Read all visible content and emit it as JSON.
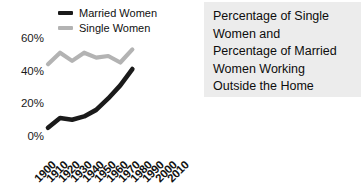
{
  "caption": {
    "lines": [
      "Percentage of Single",
      "Women and",
      "Percentage of Married",
      "Women Working",
      "Outside the Home"
    ],
    "background": "#ececec"
  },
  "legend": {
    "position": "top-left",
    "entries": [
      {
        "label": "Married Women",
        "color": "#1a1a1a"
      },
      {
        "label": "Single Women",
        "color": "#b3b3b3"
      }
    ]
  },
  "chart_data": {
    "type": "line",
    "title": "",
    "xlabel": "",
    "ylabel": "",
    "grid": false,
    "legend_position": "top-left",
    "x": [
      1900,
      1910,
      1920,
      1930,
      1940,
      1950,
      1960,
      1970,
      1980,
      1990,
      2000,
      2010
    ],
    "xtick_labels": [
      "1900",
      "1910",
      "1920",
      "1930",
      "1940",
      "1950",
      "1960",
      "1970",
      "1980",
      "1990",
      "2000",
      "2010"
    ],
    "ytick_labels": [
      "0%",
      "20%",
      "40%",
      "60%"
    ],
    "ytick_values": [
      0,
      20,
      40,
      60
    ],
    "ylim": [
      0,
      65
    ],
    "xlim": [
      1900,
      2010
    ],
    "series": [
      {
        "name": "Married Women",
        "color": "#1a1a1a",
        "x": [
          1900,
          1910,
          1920,
          1930,
          1940,
          1950,
          1960,
          1970
        ],
        "values": [
          5,
          11,
          10,
          12,
          16,
          23,
          31,
          41
        ]
      },
      {
        "name": "Single Women",
        "color": "#b3b3b3",
        "x": [
          1900,
          1910,
          1920,
          1930,
          1940,
          1950,
          1960,
          1970
        ],
        "values": [
          44,
          51,
          46,
          51,
          48,
          49,
          45,
          53
        ]
      }
    ]
  }
}
